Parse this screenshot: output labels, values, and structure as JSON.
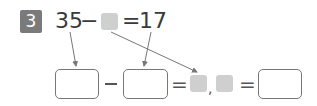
{
  "problem": {
    "number": "3",
    "equation": {
      "minuend": "35",
      "minus": "−",
      "unknown": "blank-gray-square",
      "equals": "=",
      "result": "17"
    },
    "workings": {
      "box1": "",
      "minus_arrow": "←",
      "box2": "",
      "equals1": "=",
      "comma": ",",
      "equals2": "=",
      "box3": ""
    }
  },
  "colors": {
    "badge": "#7a7a7a",
    "gray_square": "#cfcfcf",
    "box_border": "#777777",
    "arrow": "#777777"
  }
}
